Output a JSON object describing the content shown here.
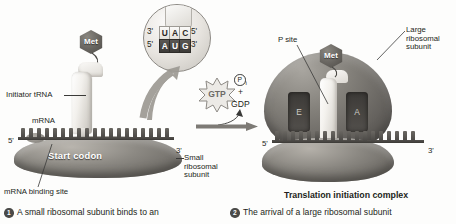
{
  "figure": {
    "background_color": "#fdfdfc",
    "ink_color": "#231f20"
  },
  "left_panel": {
    "labels": {
      "initiator_trna": "Initiator tRNA",
      "mrna": "mRNA",
      "mrna_binding_site": "mRNA binding site",
      "start_codon": "Start codon",
      "small_ribosomal_subunit": "Small\nribosomal\nsubunit",
      "small_ribosomal_subunit_lines": [
        "Small",
        "ribosomal",
        "subunit"
      ],
      "five_prime": "5'",
      "three_prime": "3'"
    },
    "met_tag": "Met",
    "magnifier": {
      "anticodon_label_left": "3'",
      "anticodon_label_right": "5'",
      "anticodon_bases": [
        "U",
        "A",
        "C"
      ],
      "codon_label_left": "5'",
      "codon_label_right": "3'",
      "codon_bases": [
        "A",
        "U",
        "G"
      ]
    },
    "caption": {
      "number": "1",
      "text": "A small ribosomal subunit binds to an"
    }
  },
  "center": {
    "gtp_label": "GTP",
    "products": {
      "pi_symbol": "P",
      "pi_subscript": "i",
      "plus": "+",
      "gdp_label": "GDP"
    }
  },
  "right_panel": {
    "labels": {
      "p_site": "P site",
      "large_ribosomal_subunit_lines": [
        "Large",
        "ribosomal",
        "subunit"
      ],
      "e_site": "E",
      "a_site": "A",
      "five_prime": "5'",
      "three_prime": "3'"
    },
    "met_tag": "Met",
    "complex_title": "Translation initiation complex",
    "caption": {
      "number": "2",
      "text": "The arrival of a large ribosomal subunit"
    }
  }
}
